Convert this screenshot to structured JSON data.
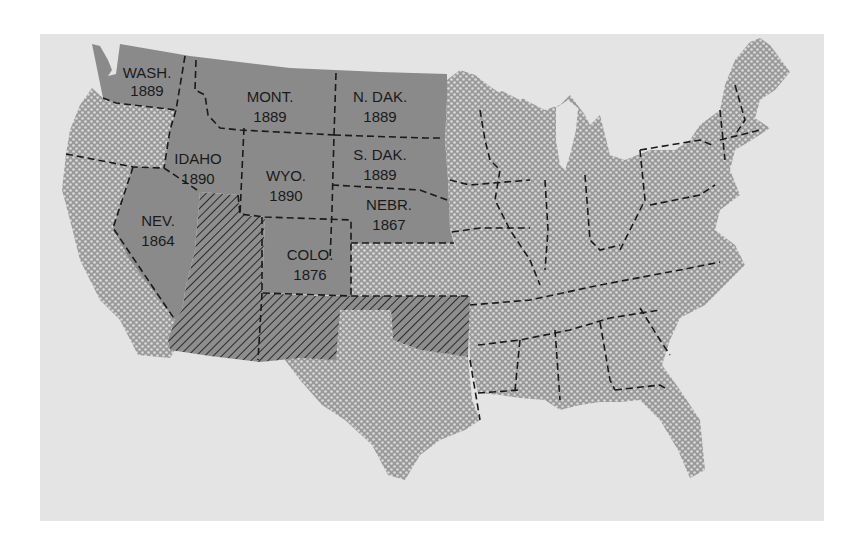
{
  "map": {
    "subject": "Western states admitted to the Union, with admission years",
    "colors": {
      "background_panel": "#e4e4e4",
      "admitted_state_fill": "#8a8a8a",
      "other_state_fill": "#9a9a9a",
      "dot_pattern": "#d8d8d8",
      "hatch_fill": "#8c8c8c",
      "hatch_line": "#2a2a2a",
      "border_line": "#1a1a1a"
    },
    "legend_categories": [
      {
        "pattern": "solid-gray",
        "meaning": "States admitted (labeled with year)"
      },
      {
        "pattern": "diagonal-hatch",
        "meaning": "Territories (Utah, Arizona, New Mexico, Oklahoma)"
      },
      {
        "pattern": "dotted",
        "meaning": "Other states"
      }
    ],
    "states": [
      {
        "name": "WASH.",
        "year": "1889"
      },
      {
        "name": "MONT.",
        "year": "1889"
      },
      {
        "name": "N. DAK.",
        "year": "1889"
      },
      {
        "name": "IDAHO",
        "year": "1890"
      },
      {
        "name": "S. DAK.",
        "year": "1889"
      },
      {
        "name": "WYO.",
        "year": "1890"
      },
      {
        "name": "NEV.",
        "year": "1864"
      },
      {
        "name": "NEBR.",
        "year": "1867"
      },
      {
        "name": "COLO.",
        "year": "1876"
      }
    ]
  }
}
